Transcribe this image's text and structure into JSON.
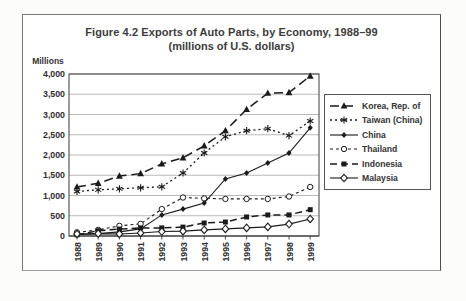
{
  "figure": {
    "title_line1": "Figure 4.2 Exports of Auto Parts, by Economy, 1988–99",
    "title_line2": "(millions of U.S. dollars)",
    "unit_label": "Millions"
  },
  "chart_data": {
    "type": "line",
    "title": "Figure 4.2 Exports of Auto Parts, by Economy, 1988–99",
    "subtitle": "(millions of U.S. dollars)",
    "xlabel": "",
    "ylabel": "Millions",
    "ylim": [
      0,
      4000
    ],
    "ytick_values": [
      0,
      500,
      1000,
      1500,
      2000,
      2500,
      3000,
      3500,
      4000
    ],
    "ytick_labels": [
      "0",
      "500",
      "1,000",
      "1,500",
      "2,000",
      "2,500",
      "3,000",
      "3,500",
      "4,000"
    ],
    "categories": [
      "1988",
      "1989",
      "1990",
      "1991",
      "1992",
      "1993",
      "1994",
      "1995",
      "1996",
      "1997",
      "1998",
      "1999"
    ],
    "grid": "horizontal",
    "legend_position": "right",
    "line_color": "#1b1b1b",
    "series": [
      {
        "name": "Korea, Rep. of",
        "marker": "triangle-filled",
        "line": "dashed",
        "values": [
          1210,
          1300,
          1480,
          1540,
          1780,
          1930,
          2225,
          2600,
          3125,
          3525,
          3540,
          3950
        ]
      },
      {
        "name": "Taiwan (China)",
        "marker": "asterisk",
        "line": "dotted",
        "values": [
          1100,
          1140,
          1165,
          1190,
          1215,
          1555,
          2050,
          2450,
          2600,
          2650,
          2480,
          2840
        ]
      },
      {
        "name": "China",
        "marker": "diamond-filled",
        "line": "solid",
        "values": [
          30,
          60,
          100,
          175,
          520,
          665,
          815,
          1410,
          1555,
          1805,
          2050,
          2670
        ]
      },
      {
        "name": "Thailand",
        "marker": "circle-open",
        "line": "short-dash",
        "values": [
          90,
          150,
          250,
          300,
          665,
          950,
          930,
          915,
          915,
          915,
          975,
          1210
        ]
      },
      {
        "name": "Indonesia",
        "marker": "square-filled",
        "line": "long-dash",
        "values": [
          30,
          130,
          170,
          200,
          200,
          220,
          320,
          345,
          470,
          520,
          520,
          650
        ]
      },
      {
        "name": "Malaysia",
        "marker": "diamond-open",
        "line": "solid",
        "values": [
          50,
          60,
          50,
          75,
          110,
          120,
          150,
          175,
          200,
          225,
          295,
          420
        ]
      }
    ]
  }
}
